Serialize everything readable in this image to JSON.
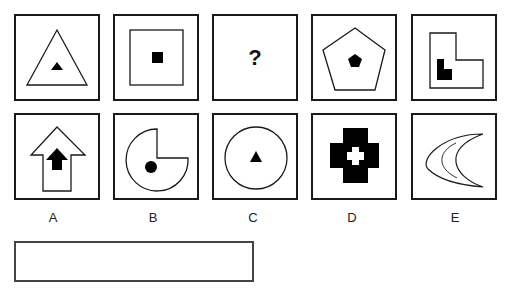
{
  "puzzle": {
    "sequence": [
      {
        "id": "seq-1",
        "outer": "triangle",
        "inner": "filled-triangle"
      },
      {
        "id": "seq-2",
        "outer": "square",
        "inner": "filled-square"
      },
      {
        "id": "seq-3",
        "outer": "unknown",
        "inner": "unknown",
        "text": "?"
      },
      {
        "id": "seq-4",
        "outer": "pentagon",
        "inner": "filled-pentagon"
      },
      {
        "id": "seq-5",
        "outer": "l-shape",
        "inner": "filled-l-shape"
      }
    ],
    "options": [
      {
        "label": "A",
        "outer": "arrow-up",
        "inner": "filled-arrow-up"
      },
      {
        "label": "B",
        "outer": "pacman-circle",
        "inner": "filled-circle"
      },
      {
        "label": "C",
        "outer": "circle",
        "inner": "filled-triangle"
      },
      {
        "label": "D",
        "outer": "filled-cross",
        "inner": "white-cross"
      },
      {
        "label": "E",
        "outer": "crescent",
        "inner": "crescent-line"
      }
    ],
    "answer": ""
  },
  "colors": {
    "stroke": "#1a1a1a",
    "fill": "#000000",
    "background": "#ffffff"
  }
}
